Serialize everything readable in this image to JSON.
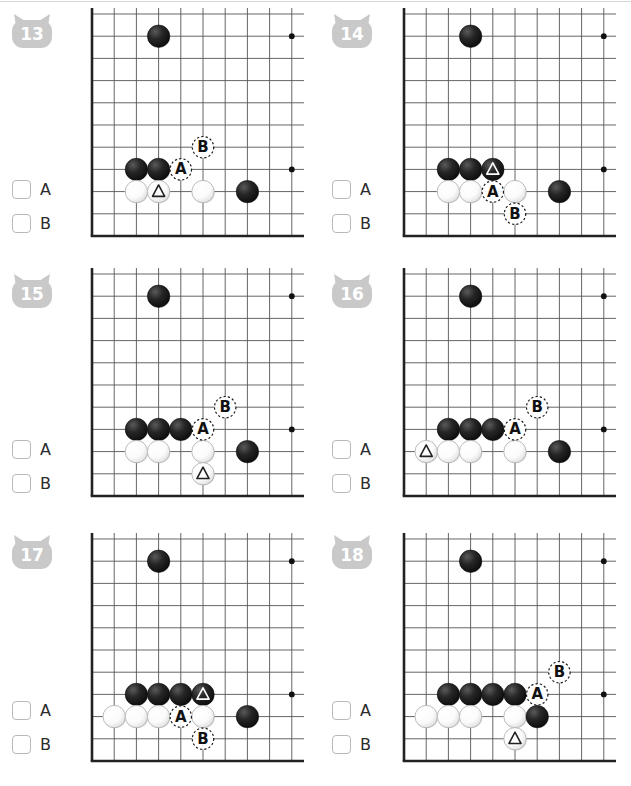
{
  "page": {
    "board_grid_cols": 10,
    "board_grid_rows": 11,
    "stone_colors": {
      "black": "#1a1a1a",
      "white": "#fcfcfc",
      "line": "#555555",
      "edge": "#222222"
    },
    "badge_color": "#c9c9c9",
    "checkbox_labels": [
      "A",
      "B"
    ]
  },
  "problems": [
    {
      "number": "13",
      "badge_icon": "cat-head-badge",
      "answers": [
        "A",
        "B"
      ],
      "stones": [
        {
          "color": "black",
          "col": 3,
          "row": 1
        },
        {
          "color": "black",
          "col": 2,
          "row": 7
        },
        {
          "color": "black",
          "col": 3,
          "row": 7
        },
        {
          "color": "white",
          "col": 2,
          "row": 8
        },
        {
          "color": "white",
          "col": 3,
          "row": 8,
          "mark": "triangle"
        },
        {
          "color": "white",
          "col": 5,
          "row": 8
        },
        {
          "color": "black",
          "col": 7,
          "row": 8
        }
      ],
      "star_points": [
        {
          "col": 9,
          "row": 1
        },
        {
          "col": 9,
          "row": 7
        }
      ],
      "labels": [
        {
          "text": "A",
          "col": 4,
          "row": 7
        },
        {
          "text": "B",
          "col": 5,
          "row": 6
        }
      ]
    },
    {
      "number": "14",
      "badge_icon": "cat-head-badge",
      "answers": [
        "A",
        "B"
      ],
      "stones": [
        {
          "color": "black",
          "col": 3,
          "row": 1
        },
        {
          "color": "black",
          "col": 2,
          "row": 7
        },
        {
          "color": "black",
          "col": 3,
          "row": 7
        },
        {
          "color": "black",
          "col": 4,
          "row": 7,
          "mark": "triangle"
        },
        {
          "color": "white",
          "col": 2,
          "row": 8
        },
        {
          "color": "white",
          "col": 3,
          "row": 8
        },
        {
          "color": "white",
          "col": 5,
          "row": 8
        },
        {
          "color": "black",
          "col": 7,
          "row": 8
        }
      ],
      "star_points": [
        {
          "col": 9,
          "row": 1
        },
        {
          "col": 9,
          "row": 7
        }
      ],
      "labels": [
        {
          "text": "A",
          "col": 4,
          "row": 8
        },
        {
          "text": "B",
          "col": 5,
          "row": 9
        }
      ]
    },
    {
      "number": "15",
      "badge_icon": "cat-head-badge",
      "answers": [
        "A",
        "B"
      ],
      "stones": [
        {
          "color": "black",
          "col": 3,
          "row": 1
        },
        {
          "color": "black",
          "col": 2,
          "row": 7
        },
        {
          "color": "black",
          "col": 3,
          "row": 7
        },
        {
          "color": "black",
          "col": 4,
          "row": 7
        },
        {
          "color": "white",
          "col": 2,
          "row": 8
        },
        {
          "color": "white",
          "col": 3,
          "row": 8
        },
        {
          "color": "white",
          "col": 5,
          "row": 8
        },
        {
          "color": "white",
          "col": 5,
          "row": 9,
          "mark": "triangle"
        },
        {
          "color": "black",
          "col": 7,
          "row": 8
        }
      ],
      "star_points": [
        {
          "col": 9,
          "row": 1
        },
        {
          "col": 9,
          "row": 7
        }
      ],
      "labels": [
        {
          "text": "A",
          "col": 5,
          "row": 7
        },
        {
          "text": "B",
          "col": 6,
          "row": 6
        }
      ]
    },
    {
      "number": "16",
      "badge_icon": "cat-head-badge",
      "answers": [
        "A",
        "B"
      ],
      "stones": [
        {
          "color": "black",
          "col": 3,
          "row": 1
        },
        {
          "color": "black",
          "col": 2,
          "row": 7
        },
        {
          "color": "black",
          "col": 3,
          "row": 7
        },
        {
          "color": "black",
          "col": 4,
          "row": 7
        },
        {
          "color": "white",
          "col": 1,
          "row": 8,
          "mark": "triangle"
        },
        {
          "color": "white",
          "col": 2,
          "row": 8
        },
        {
          "color": "white",
          "col": 3,
          "row": 8
        },
        {
          "color": "white",
          "col": 5,
          "row": 8
        },
        {
          "color": "black",
          "col": 7,
          "row": 8
        }
      ],
      "star_points": [
        {
          "col": 9,
          "row": 1
        },
        {
          "col": 9,
          "row": 7
        }
      ],
      "labels": [
        {
          "text": "A",
          "col": 5,
          "row": 7
        },
        {
          "text": "B",
          "col": 6,
          "row": 6
        }
      ]
    },
    {
      "number": "17",
      "badge_icon": "cat-head-badge",
      "answers": [
        "A",
        "B"
      ],
      "stones": [
        {
          "color": "black",
          "col": 3,
          "row": 1
        },
        {
          "color": "black",
          "col": 2,
          "row": 7
        },
        {
          "color": "black",
          "col": 3,
          "row": 7
        },
        {
          "color": "black",
          "col": 4,
          "row": 7
        },
        {
          "color": "black",
          "col": 5,
          "row": 7,
          "mark": "triangle"
        },
        {
          "color": "white",
          "col": 1,
          "row": 8
        },
        {
          "color": "white",
          "col": 2,
          "row": 8
        },
        {
          "color": "white",
          "col": 3,
          "row": 8
        },
        {
          "color": "white",
          "col": 5,
          "row": 8
        },
        {
          "color": "black",
          "col": 7,
          "row": 8
        }
      ],
      "star_points": [
        {
          "col": 9,
          "row": 1
        },
        {
          "col": 9,
          "row": 7
        }
      ],
      "labels": [
        {
          "text": "A",
          "col": 4,
          "row": 8
        },
        {
          "text": "B",
          "col": 5,
          "row": 9
        }
      ]
    },
    {
      "number": "18",
      "badge_icon": "cat-head-badge",
      "answers": [
        "A",
        "B"
      ],
      "stones": [
        {
          "color": "black",
          "col": 3,
          "row": 1
        },
        {
          "color": "black",
          "col": 2,
          "row": 7
        },
        {
          "color": "black",
          "col": 3,
          "row": 7
        },
        {
          "color": "black",
          "col": 4,
          "row": 7
        },
        {
          "color": "black",
          "col": 5,
          "row": 7
        },
        {
          "color": "white",
          "col": 1,
          "row": 8
        },
        {
          "color": "white",
          "col": 2,
          "row": 8
        },
        {
          "color": "white",
          "col": 3,
          "row": 8
        },
        {
          "color": "white",
          "col": 5,
          "row": 8
        },
        {
          "color": "white",
          "col": 5,
          "row": 9,
          "mark": "triangle"
        },
        {
          "color": "black",
          "col": 6,
          "row": 8
        }
      ],
      "star_points": [
        {
          "col": 9,
          "row": 1
        },
        {
          "col": 9,
          "row": 7
        }
      ],
      "labels": [
        {
          "text": "A",
          "col": 6,
          "row": 7
        },
        {
          "text": "B",
          "col": 7,
          "row": 6
        }
      ]
    }
  ]
}
